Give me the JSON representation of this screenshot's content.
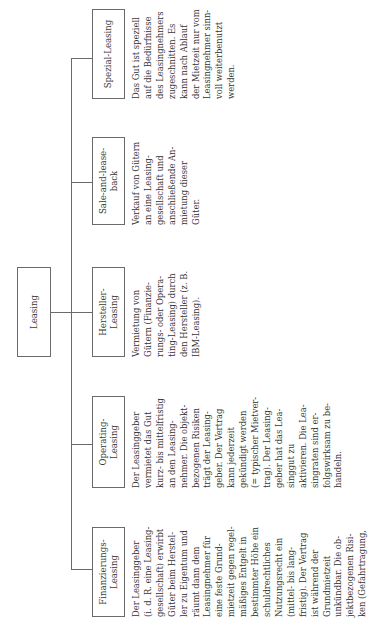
{
  "root": {
    "label": "Leasing"
  },
  "children": [
    {
      "label": "Finanzierungs-\nLeasing",
      "description": "Der Leasinggeber\n(i. d. R. eine Leasing-\ngesellschaft) erwirbt\nGüter beim Herstel-\nler zu Eigentum und\nräumt dann dem\nLeasingnehmer für\neine feste Grund-\nmietzeit gegen regel-\nmäßiges Entgelt in\nbestimmter Höhe ein\nschuldrechtliches\nNutzungsrecht ein\n(mittel- bis lang-\nfristig). Der Vertrag\nist während der\nGrundmietzeit\nunkündbar. Die ob-\njektbezogenen Risi-\nken (Gefahrtragung,"
    },
    {
      "label": "Operating-\nLeasing",
      "description": "Der Leasinggeber\nvermietet das Gut\nkurz- bis mittelfristig\nan den Leasing-\nnehmer. Die objekt-\nbezogenen Risiken\nträgt der Leasing-\ngeber. Der Vertrag\nkann jederzeit\ngekündigt werden\n(= typischer Mietver-\ntrag). Der Leasing-\ngeber hat das Lea-\nsinggut zu\naktivieren. Die Lea-\nsingraten sind er-\nfolgswirksam zu be-\nhandeln."
    },
    {
      "label": "Hersteller-\nLeasing",
      "description": "Vermietung von\nGütern (Finanzie-\nrungs- oder Opera-\nting-Leasing) durch\nden Hersteller (z. B.\nIBM-Leasing)."
    },
    {
      "label": "Sale-and-lease-\nback",
      "description": "Verkauf von Gütern\nan eine Leasing-\ngesellschaft und\nanschließende An-\nmietung dieser\nGüter."
    },
    {
      "label": "Spezial-Leasing",
      "description": "Das Gut ist speziell\nauf die Bedürfnisse\ndes Leasingnehmers\nzugeschnitten. Es\nkann nach Ablauf\nder Mietzeit nur vom\nLeasingnehmer sinn-\nvoll weiterbenutzt\nwerden."
    }
  ],
  "colors": {
    "line": "#6a6a6a",
    "text": "#333333",
    "background": "#ffffff"
  }
}
